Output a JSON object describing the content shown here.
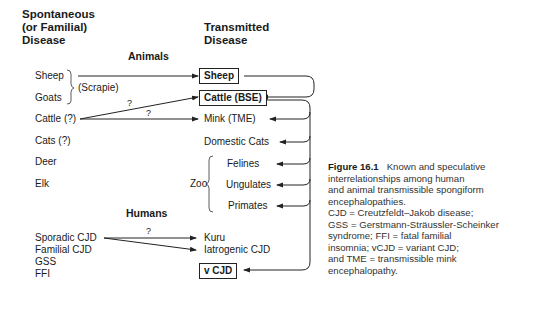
{
  "headers": {
    "left": [
      "Spontaneous",
      "(or Familial)",
      "Disease"
    ],
    "right": [
      "Transmitted",
      "Disease"
    ]
  },
  "sections": {
    "animals": "Animals",
    "humans": "Humans"
  },
  "left_animals": {
    "sheep": "Sheep",
    "goats": "Goats",
    "scrapie": "(Scrapie)",
    "cattle": "Cattle (?)",
    "cats": "Cats (?)",
    "deer": "Deer",
    "elk": "Elk",
    "zoo": "Zoo"
  },
  "right_animals": {
    "sheep": "Sheep",
    "cattle_bse": "Cattle (BSE)",
    "mink": "Mink (TME)",
    "domestic_cats": "Domestic Cats",
    "felines": "Felines",
    "ungulates": "Ungulates",
    "primates": "Primates"
  },
  "left_humans": {
    "sporadic": "Sporadic CJD",
    "familial": "Familial CJD",
    "gss": "GSS",
    "ffi": "FFI"
  },
  "right_humans": {
    "kuru": "Kuru",
    "iatrogenic": "Iatrogenic CJD",
    "vcjd": "v CJD"
  },
  "question_marks": {
    "cattle_to_bse": "?",
    "cattle_to_mink": "?",
    "sporadic_to_kuru": "?"
  },
  "caption": {
    "figure_label": "Figure 16.1",
    "lines": [
      "Known and speculative",
      "interrelationships among human",
      "and animal transmissible spongiform",
      "encephalopathies.",
      "CJD = Creutzfeldt–Jakob disease;",
      "GSS = Gerstmann-Sträussler-Scheinker",
      "syndrome; FFI = fatal familial",
      "insomnia; vCJD = variant CJD;",
      "and TME = transmissible mink",
      "encephalopathy."
    ]
  }
}
